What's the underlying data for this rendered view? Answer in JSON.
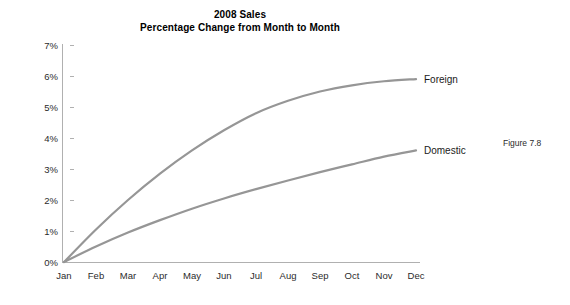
{
  "figure": {
    "caption": "Figure 7.8"
  },
  "chart_data": {
    "type": "line",
    "title": "2008 Sales\nPercentage Change from Month to Month",
    "title_lines": [
      "2008 Sales",
      "Percentage Change from Month to Month"
    ],
    "xlabel": "",
    "ylabel": "",
    "categories": [
      "Jan",
      "Feb",
      "Mar",
      "Apr",
      "May",
      "Jun",
      "Jul",
      "Aug",
      "Sep",
      "Oct",
      "Nov",
      "Dec"
    ],
    "ytick_labels": [
      "0%",
      "1%",
      "2%",
      "3%",
      "4%",
      "5%",
      "6%",
      "7%"
    ],
    "ytick_values": [
      0,
      1,
      2,
      3,
      4,
      5,
      6,
      7
    ],
    "ylim": [
      0,
      7
    ],
    "grid": false,
    "legend_position": "end-of-line",
    "series": [
      {
        "name": "Foreign",
        "color": "#969696",
        "values": [
          0.0,
          1.05,
          2.0,
          2.85,
          3.6,
          4.25,
          4.8,
          5.2,
          5.5,
          5.7,
          5.83,
          5.9
        ]
      },
      {
        "name": "Domestic",
        "color": "#969696",
        "values": [
          0.0,
          0.5,
          0.95,
          1.35,
          1.72,
          2.05,
          2.35,
          2.63,
          2.9,
          3.15,
          3.4,
          3.6
        ]
      }
    ]
  }
}
